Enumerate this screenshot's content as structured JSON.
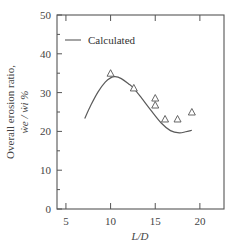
{
  "chart_data": {
    "type": "line",
    "title": "",
    "xlabel": "L/D",
    "ylabel": "Overall erosion ratio, ẇe / ẇi %",
    "ylabel_line1": "Overall erosion ratio,",
    "ylabel_line2": "ẇe / ẇi  %",
    "xlim": [
      4.0,
      22.7
    ],
    "ylim": [
      0,
      50
    ],
    "xticks": [
      5,
      10,
      15,
      20
    ],
    "yticks": [
      0,
      10,
      20,
      30,
      40,
      50
    ],
    "yminor_ticks": [
      5,
      15,
      25,
      35,
      45
    ],
    "grid": false,
    "legend": {
      "position": "upper left",
      "entries": [
        "Calculated"
      ]
    },
    "series": [
      {
        "name": "Calculated",
        "style": "line",
        "x": [
          7.1,
          7.8,
          8.6,
          9.4,
          10.0,
          10.5,
          11.2,
          12.0,
          12.6,
          13.5,
          14.5,
          15.7,
          16.7,
          17.7,
          18.4,
          19.1
        ],
        "y": [
          23.3,
          26.8,
          30.2,
          32.7,
          33.8,
          34.1,
          33.6,
          32.3,
          31.1,
          28.5,
          25.5,
          22.1,
          20.2,
          19.6,
          19.9,
          20.3
        ]
      },
      {
        "name": "Experimental",
        "style": "triangle-marker",
        "x": [
          10.0,
          12.6,
          15.0,
          15.0,
          16.1,
          17.5,
          19.1
        ],
        "y": [
          35.0,
          31.2,
          28.6,
          26.8,
          23.2,
          23.2,
          25.0
        ]
      }
    ]
  },
  "colors": {
    "axis": "#555555",
    "curve": "#5a5a5a",
    "marker": "#555555",
    "background": "#ffffff"
  }
}
